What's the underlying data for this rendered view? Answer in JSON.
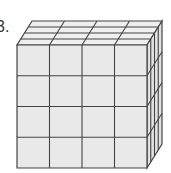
{
  "problem": {
    "number_label": "3."
  },
  "cube": {
    "grid": [
      4,
      4,
      4
    ],
    "front_color": "#e9e9e9",
    "top_color": "#efefef",
    "side_color": "#e2e2e2",
    "line_color": "#444444"
  }
}
